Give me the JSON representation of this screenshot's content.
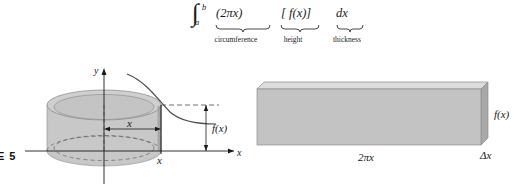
{
  "figure": {
    "caption": "RE 5"
  },
  "formula": {
    "integral_glyph": "∫",
    "limit_upper": "b",
    "limit_lower": "a",
    "terms": [
      {
        "id": "circumference",
        "expr": "(2πx)",
        "label": "circumference"
      },
      {
        "id": "height",
        "expr": "[ f(x)]",
        "label": "height"
      },
      {
        "id": "thickness",
        "expr": "dx",
        "label": "thickness"
      }
    ]
  },
  "left_diagram": {
    "name": "cylindrical-shell-diagram",
    "axis_y_label": "y",
    "axis_x_label": "x",
    "radius_label": "x",
    "edge_x_label": "x",
    "height_label": "f(x)",
    "shell_fill": "#c6c6c6",
    "shell_top_fill": "#cfcfcf",
    "shell_side_fill": "#b4b4b4",
    "curve_color": "#555555",
    "axis_color": "#1a1a1a",
    "dashed_color": "#555555"
  },
  "right_diagram": {
    "name": "unrolled-shell-diagram",
    "width_label": "2πx",
    "height_label": "f(x)",
    "thickness_label": "Δx",
    "face_fill": "#c3c3c3",
    "top_fill": "#dcdcdc",
    "side_fill": "#a8a8a8",
    "edge_color": "#8e8e8e"
  }
}
